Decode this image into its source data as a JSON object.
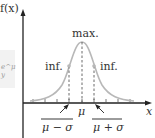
{
  "diagram": {
    "y_axis_label": "f(x)",
    "x_axis_label": "x",
    "peak_label": "max.",
    "inflection_left_label": "inf.",
    "inflection_right_label": "inf.",
    "mean_label": "μ",
    "lower_label": "μ − σ",
    "upper_label": "μ + σ",
    "side_fragment": "e^μ y"
  },
  "colors": {
    "curve": "#b8b8b8",
    "axis": "#222222",
    "text": "#333333",
    "dashed": "#444444"
  }
}
